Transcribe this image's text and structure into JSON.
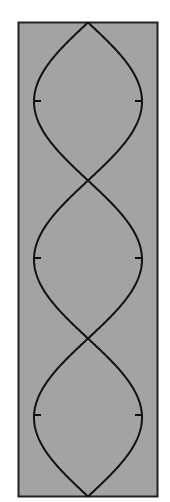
{
  "diagram": {
    "type": "standing-wave",
    "loops": 3,
    "nodes": 4,
    "colors": {
      "background": "#ffffff",
      "fill": "#a3a3a3",
      "stroke": "#111111",
      "border": "#222222"
    },
    "frame": {
      "x": 18.5,
      "y": 22.5,
      "width": 139,
      "height": 474
    },
    "center_x": 88,
    "amplitude": 54,
    "node_y": [
      22.5,
      180.5,
      338.5,
      496.5
    ],
    "antinode_y": [
      101,
      258,
      415
    ],
    "tick_length": 7
  }
}
